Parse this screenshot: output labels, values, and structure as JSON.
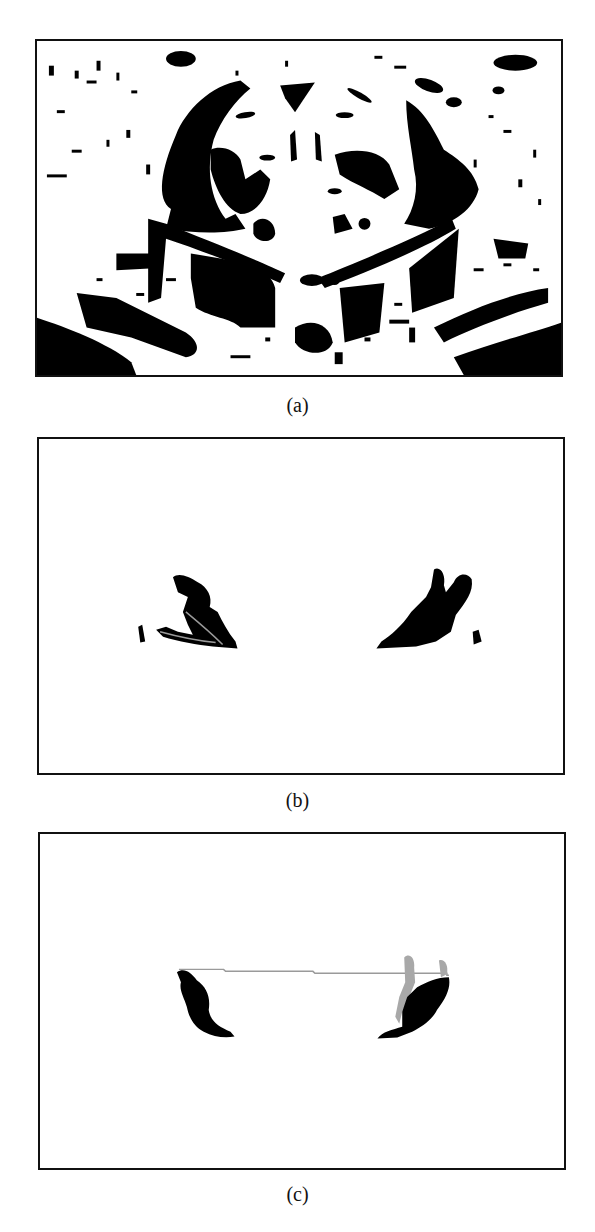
{
  "figure": {
    "panels": [
      {
        "id": "a",
        "caption": "(a)",
        "description": "Binary edge/segmentation image of a domed building with surrounding structures"
      },
      {
        "id": "b",
        "caption": "(b)",
        "description": "Extracted dome edge fragments (two dark blobs)"
      },
      {
        "id": "c",
        "caption": "(c)",
        "description": "Fitted dome base with connecting line between two dark blobs"
      }
    ]
  },
  "colors": {
    "foreground": "#000000",
    "background": "#ffffff",
    "highlight_gray": "#9a9a9a"
  }
}
